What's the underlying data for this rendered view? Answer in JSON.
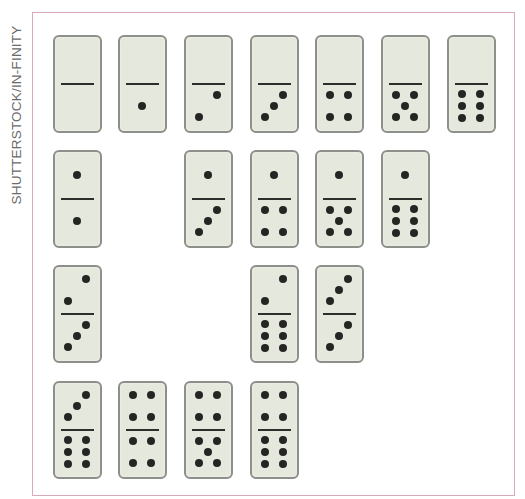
{
  "credit": "SHUTTERSTOCK/IN-FINITY",
  "colors": {
    "face": "#e5e8dc",
    "edge": "#8d8f8a",
    "pip": "#252523",
    "frame": "#d9aab8"
  },
  "grid": {
    "col_x": [
      53,
      118,
      184,
      250,
      315,
      381,
      447
    ],
    "row_y": [
      35,
      150,
      265,
      381
    ]
  },
  "dominoes": [
    {
      "row": 0,
      "col": 0,
      "top": 0,
      "bottom": 0
    },
    {
      "row": 0,
      "col": 1,
      "top": 0,
      "bottom": 1
    },
    {
      "row": 0,
      "col": 2,
      "top": 0,
      "bottom": 2
    },
    {
      "row": 0,
      "col": 3,
      "top": 0,
      "bottom": 3
    },
    {
      "row": 0,
      "col": 4,
      "top": 0,
      "bottom": 4
    },
    {
      "row": 0,
      "col": 5,
      "top": 0,
      "bottom": 5
    },
    {
      "row": 0,
      "col": 6,
      "top": 0,
      "bottom": 6
    },
    {
      "row": 1,
      "col": 0,
      "top": 1,
      "bottom": 1
    },
    {
      "row": 1,
      "col": 2,
      "top": 1,
      "bottom": 3
    },
    {
      "row": 1,
      "col": 3,
      "top": 1,
      "bottom": 4
    },
    {
      "row": 1,
      "col": 4,
      "top": 1,
      "bottom": 5
    },
    {
      "row": 1,
      "col": 5,
      "top": 1,
      "bottom": 6
    },
    {
      "row": 2,
      "col": 0,
      "top": 2,
      "bottom": 3
    },
    {
      "row": 2,
      "col": 3,
      "top": 2,
      "bottom": 6
    },
    {
      "row": 2,
      "col": 4,
      "top": 3,
      "bottom": 3
    },
    {
      "row": 3,
      "col": 0,
      "top": 3,
      "bottom": 6
    },
    {
      "row": 3,
      "col": 1,
      "top": 4,
      "bottom": 4
    },
    {
      "row": 3,
      "col": 2,
      "top": 4,
      "bottom": 5
    },
    {
      "row": 3,
      "col": 3,
      "top": 4,
      "bottom": 6
    }
  ]
}
